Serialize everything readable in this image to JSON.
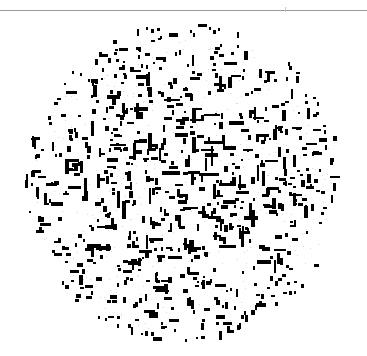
{
  "canvas": {
    "width": 367,
    "height": 356,
    "background_color": "#ffffff"
  },
  "top_rule": {
    "name": "horizontal-rule",
    "y": 10,
    "x_start": 0,
    "x_end": 367,
    "thickness": 1,
    "color": "#9a9a9a",
    "tick": {
      "x": 285,
      "y": 7,
      "height": 5,
      "color": "#c8c8c8"
    }
  },
  "disc": {
    "name": "dash-disc",
    "center_x": 183,
    "center_y": 183,
    "radius": 162,
    "mark_color": "#000000",
    "mark_count": 760,
    "orientation_mix": {
      "horizontal": 0.5,
      "vertical": 0.5
    },
    "mark_length_range": [
      2,
      21
    ],
    "mark_thickness_range": [
      2,
      4
    ],
    "density_profile": "center-weighted",
    "edge_falloff": 0.45,
    "random_seed": 20240617
  },
  "speckle": {
    "name": "background-speckle",
    "count": 420,
    "color": "#d8d8d8",
    "radius": 150,
    "random_seed": 884412
  },
  "chart_data": {
    "type": "scatter",
    "title": "",
    "subtitle": "",
    "xlabel": "",
    "ylabel": "",
    "xlim": [
      0,
      367
    ],
    "ylim": [
      0,
      356
    ],
    "grid": false,
    "legend": null,
    "annotations": [],
    "series": [
      {
        "name": "horizontal-dashes",
        "marker": "horizontal-bar",
        "color": "#000000",
        "approx_count": 380
      },
      {
        "name": "vertical-dashes",
        "marker": "vertical-bar",
        "color": "#000000",
        "approx_count": 380
      }
    ]
  }
}
